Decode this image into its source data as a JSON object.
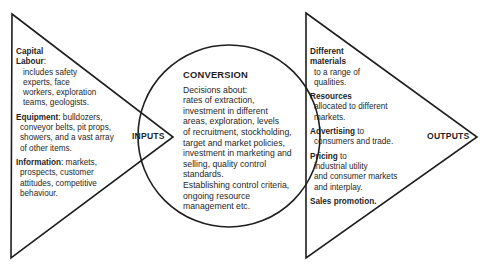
{
  "diagram": {
    "type": "process-flow",
    "flow": [
      "INPUTS",
      "CONVERSION",
      "OUTPUTS"
    ],
    "caption_partial": "...",
    "colors": {
      "stroke": "#1f1f1f",
      "text": "#1f1f1f",
      "background": "#ffffff"
    }
  },
  "inputs": {
    "label": "INPUTS",
    "groups": [
      {
        "heading": "Capital",
        "text": ""
      },
      {
        "heading": "Labour",
        "suffix": ":",
        "lines": [
          "includes safety",
          "experts, face",
          "workers, exploration",
          "teams, geologists."
        ]
      },
      {
        "heading": "Equipment",
        "suffix": ": bulldozers,",
        "lines": [
          "conveyor belts, pit props,",
          "showers, and a vast array",
          "of other items."
        ]
      },
      {
        "heading": "Information",
        "suffix": ": markets,",
        "lines": [
          "prospects, customer",
          "attitudes, competitive",
          "behaviour."
        ]
      }
    ]
  },
  "conversion": {
    "title": "CONVERSION",
    "lines": [
      "Decisions about:",
      "rates of extraction,",
      "investment in different",
      "areas, exploration, levels",
      "of recruitment, stockholding,",
      "target and market policies,",
      "investment in marketing and",
      "selling, quality control",
      "standards.",
      "Establishing control criteria,",
      "ongoing resource",
      "management etc."
    ]
  },
  "outputs": {
    "label": "OUTPUTS",
    "groups": [
      {
        "heading1": "Different",
        "heading2": "materials",
        "lines": [
          "to a range of",
          "qualities."
        ]
      },
      {
        "heading1": "Resources",
        "lines": [
          "allocated to different",
          "markets."
        ]
      },
      {
        "heading1": "Advertising",
        "suffix": " to",
        "lines": [
          "consumers and trade."
        ]
      },
      {
        "heading1": "Pricing",
        "suffix": " to",
        "lines": [
          "industrial utility",
          "and consumer markets",
          "and interplay."
        ]
      },
      {
        "heading1": "Sales promotion.",
        "lines": []
      }
    ]
  }
}
